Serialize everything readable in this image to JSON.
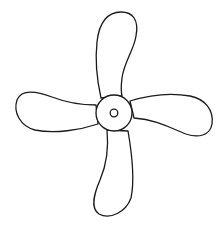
{
  "figure": {
    "blade_count": 4,
    "colors": {
      "stroke": "#1a1a1a",
      "fill": "#ffffff",
      "background": "#ffffff"
    },
    "hub": {
      "cx": 114,
      "cy": 113,
      "outer_r": 18,
      "inner_r": 3.8
    }
  }
}
